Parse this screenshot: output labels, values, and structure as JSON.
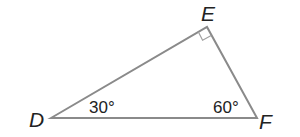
{
  "diagram": {
    "type": "right-triangle",
    "colors": {
      "stroke": "#8a8a8a",
      "text": "#222222",
      "background": "#ffffff"
    },
    "vertices": [
      {
        "id": "D",
        "label": "D",
        "x": 51,
        "y": 118
      },
      {
        "id": "E",
        "label": "E",
        "x": 207,
        "y": 27
      },
      {
        "id": "F",
        "label": "F",
        "x": 257,
        "y": 118
      }
    ],
    "angles": [
      {
        "vertex": "D",
        "label": "30°"
      },
      {
        "vertex": "F",
        "label": "60°"
      },
      {
        "vertex": "E",
        "label": "right-angle-marker"
      }
    ]
  }
}
